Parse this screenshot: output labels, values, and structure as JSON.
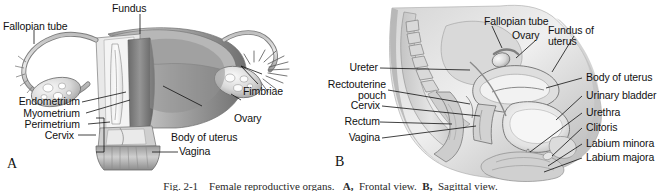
{
  "figure": {
    "caption_prefix": "Fig. 2-1",
    "caption_text": "Female reproductive organs.",
    "caption_a": "A,",
    "caption_a_text": "Frontal view.",
    "caption_b": "B,",
    "caption_b_text": "Sagittal view.",
    "background_color": "#ffffff",
    "ink_color": "#111111"
  },
  "panel_a": {
    "letter": "A",
    "view": "Frontal view",
    "labels": [
      {
        "id": "fallopian-tube",
        "text": "Fallopian tube"
      },
      {
        "id": "fundus",
        "text": "Fundus"
      },
      {
        "id": "fimbriae",
        "text": "Fimbriae"
      },
      {
        "id": "ovary",
        "text": "Ovary"
      },
      {
        "id": "endometrium",
        "text": "Endometrium"
      },
      {
        "id": "myometrium",
        "text": "Myometrium"
      },
      {
        "id": "perimetrium",
        "text": "Perimetrium"
      },
      {
        "id": "cervix",
        "text": "Cervix"
      },
      {
        "id": "body-of-uterus",
        "text": "Body of uterus"
      },
      {
        "id": "vagina",
        "text": "Vagina"
      }
    ]
  },
  "panel_b": {
    "letter": "B",
    "view": "Sagittal view",
    "labels": [
      {
        "id": "fallopian-tube",
        "text": "Fallopian tube"
      },
      {
        "id": "ovary",
        "text": "Ovary"
      },
      {
        "id": "fundus-of-uterus-l1",
        "text": "Fundus of"
      },
      {
        "id": "fundus-of-uterus-l2",
        "text": "uterus"
      },
      {
        "id": "ureter",
        "text": "Ureter"
      },
      {
        "id": "rectouterine-pouch-l1",
        "text": "Rectouterine"
      },
      {
        "id": "rectouterine-pouch-l2",
        "text": "pouch"
      },
      {
        "id": "cervix",
        "text": "Cervix"
      },
      {
        "id": "rectum",
        "text": "Rectum"
      },
      {
        "id": "vagina",
        "text": "Vagina"
      },
      {
        "id": "body-of-uterus",
        "text": "Body of uterus"
      },
      {
        "id": "urinary-bladder",
        "text": "Urinary bladder"
      },
      {
        "id": "urethra",
        "text": "Urethra"
      },
      {
        "id": "clitoris",
        "text": "Clitoris"
      },
      {
        "id": "labium-minora",
        "text": "Labium minora"
      },
      {
        "id": "labium-majora",
        "text": "Labium majora"
      }
    ]
  }
}
